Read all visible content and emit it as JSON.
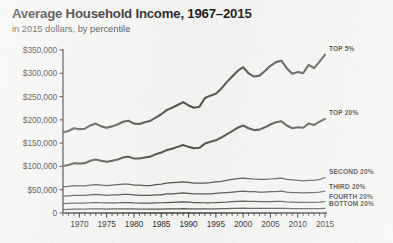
{
  "header": {
    "title": "Average Household Income, 1967–2015",
    "subtitle": "in 2015 dollars, by percentile"
  },
  "colors": {
    "background": "#f4f4f2",
    "line": "#56534f",
    "axis": "#3d3b39",
    "text": "#231f20"
  },
  "chart_data": {
    "type": "line",
    "title": "Average Household Income, 1967–2015",
    "subtitle": "in 2015 dollars, by percentile",
    "xlabel": "",
    "ylabel": "",
    "xlim": [
      1967,
      2015
    ],
    "ylim": [
      0,
      350000
    ],
    "grid": false,
    "legend_position": "right-inline",
    "y_ticks": [
      0,
      50000,
      100000,
      150000,
      200000,
      250000,
      300000,
      350000
    ],
    "y_tick_labels": [
      "0",
      "$50,000",
      "$100,000",
      "$150,000",
      "$200,000",
      "$250,000",
      "$300,000",
      "$350,000"
    ],
    "x_ticks": [
      1970,
      1975,
      1980,
      1985,
      1990,
      1995,
      2000,
      2005,
      2010,
      2015
    ],
    "x_tick_labels": [
      "1970",
      "1975",
      "1980",
      "1985",
      "1990",
      "1995",
      "2000",
      "2005",
      "2010",
      "2015"
    ],
    "x_minor_tick_step": 1,
    "x": [
      1967,
      1968,
      1969,
      1970,
      1971,
      1972,
      1973,
      1974,
      1975,
      1976,
      1977,
      1978,
      1979,
      1980,
      1981,
      1982,
      1983,
      1984,
      1985,
      1986,
      1987,
      1988,
      1989,
      1990,
      1991,
      1992,
      1993,
      1994,
      1995,
      1996,
      1997,
      1998,
      1999,
      2000,
      2001,
      2002,
      2003,
      2004,
      2005,
      2006,
      2007,
      2008,
      2009,
      2010,
      2011,
      2012,
      2013,
      2014,
      2015
    ],
    "series": [
      {
        "name": "TOP 5%",
        "label": "TOP 5%",
        "values": [
          173000,
          176000,
          182000,
          180000,
          181000,
          188000,
          192000,
          186000,
          183000,
          186000,
          190000,
          196000,
          198000,
          192000,
          191000,
          195000,
          198000,
          205000,
          212000,
          221000,
          226000,
          232000,
          238000,
          231000,
          226000,
          228000,
          247000,
          252000,
          256000,
          267000,
          281000,
          293000,
          305000,
          313000,
          300000,
          293000,
          295000,
          305000,
          316000,
          324000,
          327000,
          311000,
          299000,
          303000,
          300000,
          318000,
          311000,
          325000,
          340000
        ]
      },
      {
        "name": "TOP 20%",
        "label": "TOP 20%",
        "values": [
          101000,
          103000,
          107000,
          106000,
          107000,
          112000,
          115000,
          112000,
          110000,
          112000,
          115000,
          119000,
          121000,
          117000,
          117000,
          119000,
          121000,
          126000,
          130000,
          135000,
          138000,
          142000,
          146000,
          142000,
          139000,
          140000,
          149000,
          153000,
          156000,
          162000,
          169000,
          176000,
          183000,
          188000,
          182000,
          178000,
          179000,
          184000,
          190000,
          195000,
          197000,
          188000,
          182000,
          184000,
          183000,
          192000,
          189000,
          196000,
          202000
        ]
      },
      {
        "name": "SECOND 20%",
        "label": "SECOND 20%",
        "values": [
          56000,
          57000,
          59000,
          58000,
          58000,
          60000,
          61000,
          60000,
          59000,
          60000,
          61000,
          62000,
          62000,
          60000,
          60000,
          59000,
          59000,
          61000,
          62000,
          64000,
          65000,
          66000,
          67000,
          66000,
          64000,
          64000,
          64000,
          65000,
          67000,
          68000,
          70000,
          72000,
          74000,
          75000,
          74000,
          73000,
          72000,
          72000,
          73000,
          74000,
          75000,
          72000,
          71000,
          70000,
          69000,
          70000,
          70000,
          72000,
          76000
        ]
      },
      {
        "name": "THIRD 20%",
        "label": "THIRD 20%",
        "values": [
          36000,
          37000,
          38000,
          38000,
          38000,
          39000,
          40000,
          39000,
          38000,
          39000,
          39000,
          40000,
          40000,
          39000,
          38000,
          38000,
          38000,
          39000,
          39000,
          41000,
          41000,
          42000,
          43000,
          42000,
          41000,
          41000,
          41000,
          41000,
          42000,
          43000,
          44000,
          45000,
          46000,
          47000,
          46000,
          46000,
          45000,
          45000,
          46000,
          46000,
          47000,
          45000,
          44000,
          44000,
          43000,
          44000,
          44000,
          45000,
          47000
        ]
      },
      {
        "name": "FOURTH 20%",
        "label": "FOURTH 20%",
        "values": [
          20000,
          20500,
          21000,
          21000,
          21000,
          22000,
          22500,
          22000,
          21500,
          22000,
          22000,
          22500,
          22500,
          21500,
          21000,
          21000,
          21000,
          21500,
          22000,
          22500,
          23000,
          23500,
          24000,
          23500,
          22500,
          22500,
          22000,
          22000,
          22500,
          23000,
          23500,
          24500,
          25000,
          25500,
          25000,
          25000,
          24500,
          24500,
          24500,
          25000,
          25000,
          24000,
          23500,
          23000,
          23000,
          23000,
          23000,
          23500,
          24500
        ]
      },
      {
        "name": "BOTTOM 20%",
        "label": "BOTTOM 20%",
        "values": [
          7500,
          7800,
          8200,
          8200,
          8300,
          8700,
          9000,
          8800,
          8500,
          8700,
          8800,
          9000,
          9000,
          8600,
          8400,
          8200,
          8200,
          8400,
          8500,
          8800,
          9000,
          9100,
          9300,
          9100,
          8800,
          8700,
          8600,
          8700,
          9000,
          9200,
          9500,
          9800,
          10100,
          10300,
          10100,
          10000,
          9900,
          9900,
          9900,
          10000,
          10100,
          9700,
          9500,
          9300,
          9200,
          9200,
          9200,
          9400,
          9800
        ]
      }
    ]
  }
}
